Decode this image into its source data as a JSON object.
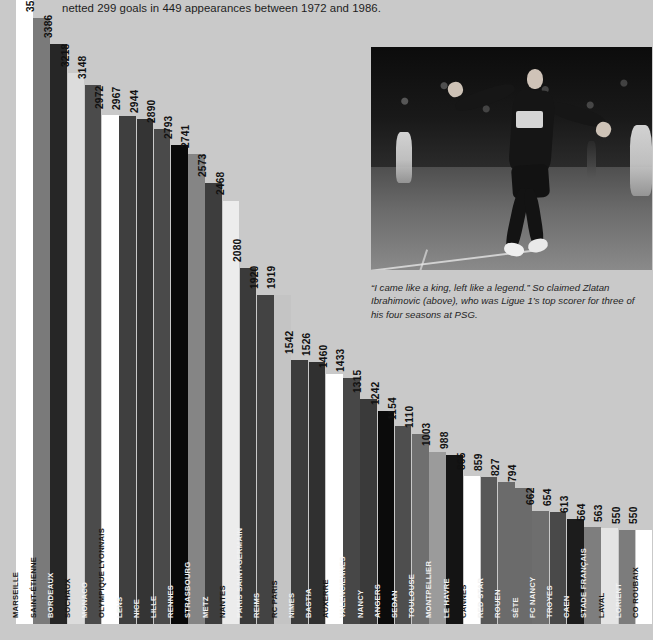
{
  "intro": {
    "text": "netted 299 goals in 449 appearances between 1972 and 1986."
  },
  "photo": {
    "alt": "zlatan-ibrahimovic-celebrating-photo",
    "jersey_sponsor": "Fly Emirates"
  },
  "caption": {
    "text": "“I came like a king, left like a legend.” So claimed Zlatan Ibrahimovic (above), who was Ligue 1’s top scorer for three of his four seasons at PSG."
  },
  "chart_data": {
    "type": "bar",
    "title": "",
    "xlabel": "",
    "ylabel": "",
    "ylim": [
      0,
      3641
    ],
    "grid": false,
    "legend": "none",
    "orientation": "vertical",
    "categories": [
      "MARSEILLE",
      "SAINT-ÉTIENNE",
      "BORDEAUX",
      "SOCHAUX",
      "MONACO",
      "OLYMPIQUE LYONNAIS",
      "LENS",
      "NICE",
      "LILLE",
      "RENNES",
      "STRASBOURG",
      "METZ",
      "NANTES",
      "PARIS SAINT-GERMAIN",
      "REIMS",
      "RC PARIS",
      "NIMES",
      "BASTIA",
      "AUXERRE",
      "VALENCIENNES",
      "NANCY",
      "ANGERS",
      "SEDAN",
      "TOULOUSE",
      "MONTPELLIER",
      "LE HAVRE",
      "CANNES",
      "RED STAR",
      "ROUEN",
      "SÈTE",
      "FC NANCY",
      "TROYES",
      "CAEN",
      "STADE FRANÇAIS",
      "LAVAL",
      "LORIENT",
      "CO ROUBAIX"
    ],
    "values": [
      3641,
      3536,
      3386,
      3218,
      3148,
      2972,
      2967,
      2944,
      2890,
      2793,
      2741,
      2573,
      2468,
      2080,
      1920,
      1919,
      1542,
      1526,
      1460,
      1433,
      1315,
      1242,
      1154,
      1110,
      1003,
      988,
      865,
      859,
      827,
      794,
      662,
      654,
      613,
      564,
      563,
      550,
      550
    ],
    "bars": [
      {
        "label": "MARSEILLE",
        "value": 3641,
        "color": "#ffffff",
        "label_tone": "dark"
      },
      {
        "label": "SAINT-ÉTIENNE",
        "value": 3536,
        "color": "#7a7a7a",
        "label_tone": "dark"
      },
      {
        "label": "BORDEAUX",
        "value": 3386,
        "color": "#262626",
        "label_tone": "light"
      },
      {
        "label": "SOCHAUX",
        "value": 3218,
        "color": "#dcdcdc",
        "label_tone": "dark"
      },
      {
        "label": "MONACO",
        "value": 3148,
        "color": "#4b4b4b",
        "label_tone": "light"
      },
      {
        "label": "OLYMPIQUE LYONNAIS",
        "value": 2972,
        "color": "#ffffff",
        "label_tone": "dark"
      },
      {
        "label": "LENS",
        "value": 2967,
        "color": "#3f3f3f",
        "label_tone": "light"
      },
      {
        "label": "NICE",
        "value": 2944,
        "color": "#343434",
        "label_tone": "light"
      },
      {
        "label": "LILLE",
        "value": 2890,
        "color": "#4a4a4a",
        "label_tone": "light"
      },
      {
        "label": "RENNES",
        "value": 2793,
        "color": "#090909",
        "label_tone": "light"
      },
      {
        "label": "STRASBOURG",
        "value": 2741,
        "color": "#858585",
        "label_tone": "light"
      },
      {
        "label": "METZ",
        "value": 2573,
        "color": "#3d3d3d",
        "label_tone": "light"
      },
      {
        "label": "NANTES",
        "value": 2468,
        "color": "#ececec",
        "label_tone": "dark"
      },
      {
        "label": "PARIS SAINT-GERMAIN",
        "value": 2080,
        "color": "#3a3a3a",
        "label_tone": "light"
      },
      {
        "label": "REIMS",
        "value": 1920,
        "color": "#434343",
        "label_tone": "light"
      },
      {
        "label": "RC PARIS",
        "value": 1919,
        "color": "#c4c4c4",
        "label_tone": "dark"
      },
      {
        "label": "NIMES",
        "value": 1542,
        "color": "#3c3c3c",
        "label_tone": "light"
      },
      {
        "label": "BASTIA",
        "value": 1526,
        "color": "#303030",
        "label_tone": "light"
      },
      {
        "label": "AUXERRE",
        "value": 1460,
        "color": "#ffffff",
        "label_tone": "dark"
      },
      {
        "label": "VALENCIENNES",
        "value": 1433,
        "color": "#474747",
        "label_tone": "light"
      },
      {
        "label": "NANCY",
        "value": 1315,
        "color": "#3a3a3a",
        "label_tone": "light"
      },
      {
        "label": "ANGERS",
        "value": 1242,
        "color": "#0b0b0b",
        "label_tone": "light"
      },
      {
        "label": "SEDAN",
        "value": 1154,
        "color": "#4e4e4e",
        "label_tone": "light"
      },
      {
        "label": "TOULOUSE",
        "value": 1110,
        "color": "#6f6f6f",
        "label_tone": "light"
      },
      {
        "label": "MONTPELLIER",
        "value": 1003,
        "color": "#9b9b9b",
        "label_tone": "light"
      },
      {
        "label": "LE HAVRE",
        "value": 988,
        "color": "#141414",
        "label_tone": "light"
      },
      {
        "label": "CANNES",
        "value": 865,
        "color": "#ffffff",
        "label_tone": "dark"
      },
      {
        "label": "RED STAR",
        "value": 859,
        "color": "#585858",
        "label_tone": "light"
      },
      {
        "label": "ROUEN",
        "value": 827,
        "color": "#6b6b6b",
        "label_tone": "light"
      },
      {
        "label": "SÈTE",
        "value": 794,
        "color": "#6b6b6b",
        "label_tone": "light"
      },
      {
        "label": "FC NANCY",
        "value": 662,
        "color": "#6e6e6e",
        "label_tone": "light"
      },
      {
        "label": "TROYES",
        "value": 654,
        "color": "#494949",
        "label_tone": "light"
      },
      {
        "label": "CAEN",
        "value": 613,
        "color": "#1c1c1c",
        "label_tone": "light"
      },
      {
        "label": "STADE FRANÇAIS",
        "value": 564,
        "color": "#7e7e7e",
        "label_tone": "light"
      },
      {
        "label": "LAVAL",
        "value": 563,
        "color": "#e4e4e4",
        "label_tone": "dark"
      },
      {
        "label": "LORIENT",
        "value": 550,
        "color": "#7c7c7c",
        "label_tone": "light"
      },
      {
        "label": "CO ROUBAIX",
        "value": 550,
        "color": "#ffffff",
        "label_tone": "dark"
      }
    ]
  }
}
